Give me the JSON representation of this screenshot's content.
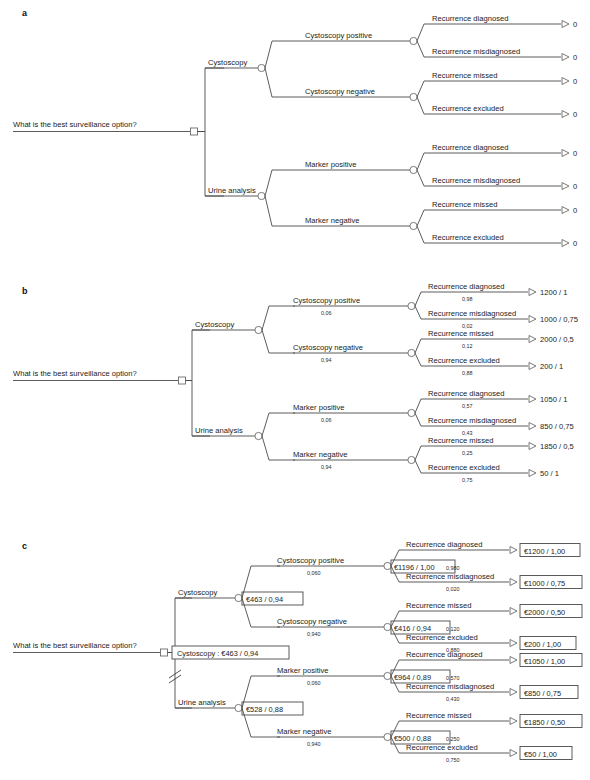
{
  "figure": {
    "type": "decision-tree",
    "panels": [
      {
        "letter": "a",
        "name": "structure-only"
      },
      {
        "letter": "b",
        "name": "probabilities-and-payoffs"
      },
      {
        "letter": "c",
        "name": "rolled-back-expected-values"
      }
    ]
  },
  "root": {
    "question": "What is the best surveillance option?",
    "decision_label_c": "Cystoscopy : €463 / 0,94"
  },
  "strategies": [
    {
      "id": "cystoscopy",
      "label": "Cystoscopy",
      "value_c": "€463 / 0,94"
    },
    {
      "id": "urine-analysis",
      "label": "Urine analysis",
      "value_c": "€528 / 0,88"
    }
  ],
  "branches": {
    "cystoscopy": [
      {
        "label": "Cystoscopy positive",
        "prob_b": "0,06",
        "prob_c": "0,060",
        "value_c": "€1196 / 1,00",
        "outcomes": [
          {
            "label": "Recurrence diagnosed",
            "prob_b": "0,98",
            "prob_c": "0,980",
            "payoff_a": "0",
            "payoff_b": "1200 / 1",
            "payoff_c": "€1200 / 1,00"
          },
          {
            "label": "Recurrence misdiagnosed",
            "prob_b": "0,02",
            "prob_c": "0,020",
            "payoff_a": "0",
            "payoff_b": "1000 / 0,75",
            "payoff_c": "€1000 / 0,75"
          }
        ]
      },
      {
        "label": "Cystoscopy negative",
        "prob_b": "0,94",
        "prob_c": "0,940",
        "value_c": "€416 / 0,94",
        "outcomes": [
          {
            "label": "Recurrence missed",
            "prob_b": "0,12",
            "prob_c": "0,120",
            "payoff_a": "0",
            "payoff_b": "2000 / 0,5",
            "payoff_c": "€2000 / 0,50"
          },
          {
            "label": "Recurrence excluded",
            "prob_b": "0,88",
            "prob_c": "0,880",
            "payoff_a": "0",
            "payoff_b": "200 / 1",
            "payoff_c": "€200 / 1,00"
          }
        ]
      }
    ],
    "urine-analysis": [
      {
        "label": "Marker positive",
        "prob_b": "0,06",
        "prob_c": "0,060",
        "value_c": "€964 / 0,89",
        "outcomes": [
          {
            "label": "Recurrence diagnosed",
            "prob_b": "0,57",
            "prob_c": "0,570",
            "payoff_a": "0",
            "payoff_b": "1050 / 1",
            "payoff_c": "€1050 / 1,00"
          },
          {
            "label": "Recurrence misdiagnosed",
            "prob_b": "0,43",
            "prob_c": "0,430",
            "payoff_a": "0",
            "payoff_b": "850 / 0,75",
            "payoff_c": "€850 / 0,75"
          }
        ]
      },
      {
        "label": "Marker negative",
        "prob_b": "0,94",
        "prob_c": "0,940",
        "value_c": "€500 / 0,88",
        "outcomes": [
          {
            "label": "Recurrence missed",
            "prob_b": "0,25",
            "prob_c": "0,250",
            "payoff_a": "0",
            "payoff_b": "1850 / 0,5",
            "payoff_c": "€1850 / 0,50"
          },
          {
            "label": "Recurrence excluded",
            "prob_b": "0,75",
            "prob_c": "0,750",
            "payoff_a": "0",
            "payoff_b": "50 / 1",
            "payoff_c": "€50 / 1,00"
          }
        ]
      }
    ]
  }
}
